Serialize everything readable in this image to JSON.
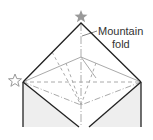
{
  "diagram": {
    "annotation": {
      "line1": "Mountain",
      "line2": "fold"
    },
    "markers": [
      {
        "type": "star-filled",
        "position": "top-apex"
      },
      {
        "type": "star-outline",
        "position": "left-corner"
      }
    ],
    "colors": {
      "outline": "#222222",
      "fold_lines": "#aaaaaa",
      "shade": "#eeeeee",
      "star": "#999999"
    }
  }
}
